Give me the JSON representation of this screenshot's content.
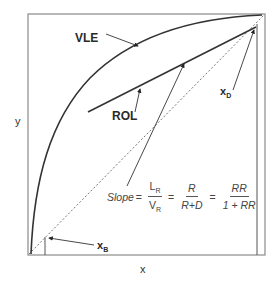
{
  "diagram": {
    "type": "McCabe-Thiele rectifying section diagram",
    "axes": {
      "x_label": "x",
      "y_label": "y"
    },
    "curves": {
      "vle_label": "VLE",
      "rol_label": "ROL",
      "diagonal": "y = x (dashed)"
    },
    "annotations": {
      "xd_label": "x",
      "xd_sub": "D",
      "xb_label": "x",
      "xb_sub": "B"
    },
    "formula": {
      "slope_word": "Slope",
      "eq": "=",
      "frac1_num": "L",
      "frac1_num_sub": "R",
      "frac1_den": "V",
      "frac1_den_sub": "R",
      "frac2_num": "R",
      "frac2_den": "R+D",
      "frac3_num": "RR",
      "frac3_den": "1 + RR"
    },
    "colors": {
      "frame": "#8a8a8a",
      "curve": "#3a3a3a",
      "text": "#2a2a2a"
    }
  }
}
